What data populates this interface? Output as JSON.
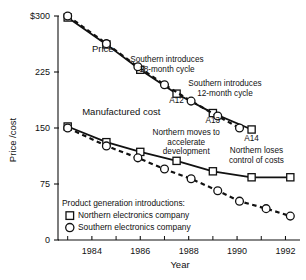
{
  "chart_data": {
    "type": "line",
    "title": "",
    "xlabel": "Year",
    "ylabel": "Price /cost",
    "xlim": [
      1982.6,
      1992.6
    ],
    "ylim": [
      0,
      300
    ],
    "xticks_major": [
      1984,
      1986,
      1988,
      1990,
      1992
    ],
    "xticks_minor": [
      1983,
      1985,
      1987,
      1989,
      1991
    ],
    "yticks": [
      0,
      75,
      150,
      225,
      300
    ],
    "ytick_labels": [
      "0",
      "75",
      "150",
      "225",
      "$300"
    ],
    "grid": false,
    "legend_position": "lower-left-inside",
    "legend_title": "Product generation introductions:",
    "series": [
      {
        "name": "Price",
        "marker": "square",
        "line": "solid",
        "role": "northern-price",
        "points": [
          {
            "x": 1983.0,
            "y": 298
          },
          {
            "x": 1984.6,
            "y": 262
          },
          {
            "x": 1986.0,
            "y": 228
          },
          {
            "x": 1987.5,
            "y": 196
          },
          {
            "x": 1989.0,
            "y": 170
          },
          {
            "x": 1990.6,
            "y": 148
          }
        ]
      },
      {
        "name": "Price",
        "marker": "circle",
        "line": "dashed",
        "role": "southern-price",
        "points": [
          {
            "x": 1983.0,
            "y": 300
          },
          {
            "x": 1984.6,
            "y": 263
          },
          {
            "x": 1985.9,
            "y": 232
          },
          {
            "x": 1987.0,
            "y": 208
          },
          {
            "x": 1988.1,
            "y": 186
          },
          {
            "x": 1989.2,
            "y": 166
          },
          {
            "x": 1990.1,
            "y": 150
          }
        ]
      },
      {
        "name": "Manufactured cost",
        "marker": "square",
        "line": "solid",
        "role": "northern-cost",
        "points": [
          {
            "x": 1983.0,
            "y": 152
          },
          {
            "x": 1984.6,
            "y": 131
          },
          {
            "x": 1986.0,
            "y": 118
          },
          {
            "x": 1987.5,
            "y": 106
          },
          {
            "x": 1989.0,
            "y": 92
          },
          {
            "x": 1990.6,
            "y": 84
          },
          {
            "x": 1992.2,
            "y": 84
          }
        ]
      },
      {
        "name": "Manufactured cost",
        "marker": "circle",
        "line": "dashed",
        "role": "southern-cost",
        "points": [
          {
            "x": 1983.0,
            "y": 150
          },
          {
            "x": 1984.6,
            "y": 126
          },
          {
            "x": 1985.9,
            "y": 110
          },
          {
            "x": 1987.0,
            "y": 95
          },
          {
            "x": 1988.1,
            "y": 82
          },
          {
            "x": 1989.2,
            "y": 66
          },
          {
            "x": 1990.1,
            "y": 52
          },
          {
            "x": 1991.2,
            "y": 42
          },
          {
            "x": 1992.2,
            "y": 32
          }
        ]
      }
    ],
    "annotations": [
      {
        "id": "price",
        "text": "Price",
        "x": 1984.0,
        "y": 252
      },
      {
        "id": "manufactured-cost",
        "text": "Manufactured cost",
        "x": 1983.6,
        "y": 168
      },
      {
        "id": "southern-18-month",
        "line1": "Southern introduces",
        "line2": "18-month cycle",
        "x": 1987.1,
        "y": 238
      },
      {
        "id": "southern-12-month",
        "line1": "Southern introduces",
        "line2": "12-month cycle",
        "x": 1989.5,
        "y": 206
      },
      {
        "id": "northern-accelerate",
        "line1": "Northern moves to",
        "line2": "accelerate",
        "line3": "development",
        "x": 1987.9,
        "y": 140
      },
      {
        "id": "northern-loses-control",
        "line1": "Northern loses",
        "line2": "control of costs",
        "x": 1990.8,
        "y": 116
      }
    ],
    "point_labels": [
      {
        "id": "A12",
        "text": "A12",
        "x": 1987.5,
        "y": 183
      },
      {
        "id": "A13",
        "text": "A13",
        "x": 1989.0,
        "y": 157
      },
      {
        "id": "A14",
        "text": "A14",
        "x": 1990.6,
        "y": 133
      }
    ],
    "legend_entries": [
      {
        "marker": "square",
        "label": "Northern electronics company"
      },
      {
        "marker": "circle",
        "label": "Southern electronics company"
      }
    ]
  }
}
